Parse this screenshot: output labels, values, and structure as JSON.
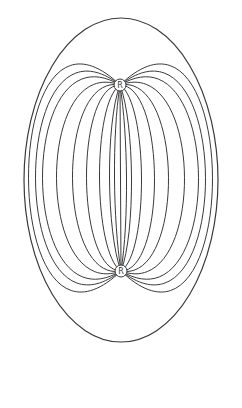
{
  "diagram": {
    "type": "field-lines",
    "colors": {
      "line": "#3a3a3a",
      "background": "#ffffff"
    },
    "outer_boundary": {
      "cx": 121,
      "cy": 180,
      "rx": 97,
      "ry": 162
    },
    "nodes": [
      {
        "id": "top",
        "label": "R",
        "x": 120,
        "y": 85,
        "r": 6
      },
      {
        "id": "bottom",
        "label": "R",
        "x": 121,
        "y": 271,
        "r": 6
      }
    ],
    "field_lines_half_widths": [
      92,
      85,
      78,
      64,
      48,
      34,
      21,
      11,
      6,
      0
    ]
  }
}
